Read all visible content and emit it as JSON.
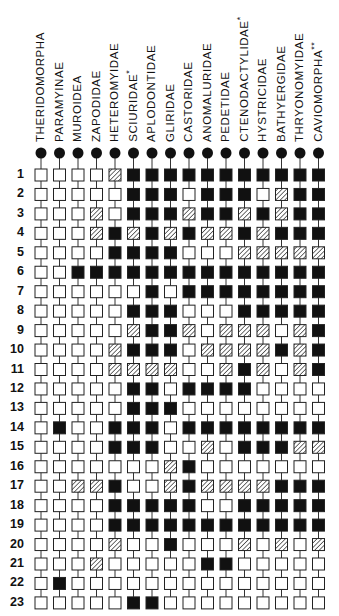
{
  "figure": {
    "type": "character-state-matrix",
    "legend_states": {
      "0": "open (white) square",
      "1": "hatched square",
      "2": "filled (black) square"
    },
    "colors": {
      "ink": "#111111",
      "background": "#ffffff"
    }
  },
  "taxa": [
    {
      "label": "THERIDOMORPHA",
      "mark": ""
    },
    {
      "label": "PARAMYINAE",
      "mark": ""
    },
    {
      "label": "MUROIDEA",
      "mark": ""
    },
    {
      "label": "ZAPODIDAE",
      "mark": ""
    },
    {
      "label": "HETEROMYIDAE",
      "mark": ""
    },
    {
      "label": "SCIURIDAE",
      "mark": "*"
    },
    {
      "label": "APLODONTIDAE",
      "mark": ""
    },
    {
      "label": "GLIRIDAE",
      "mark": ""
    },
    {
      "label": "CASTORIDAE",
      "mark": ""
    },
    {
      "label": "ANOMALURIDAE",
      "mark": ""
    },
    {
      "label": "PEDETIDAE",
      "mark": ""
    },
    {
      "label": "CTENODACTYLIDAE",
      "mark": "*"
    },
    {
      "label": "HYSTRICIDAE",
      "mark": ""
    },
    {
      "label": "BATHYERGIDAE",
      "mark": ""
    },
    {
      "label": "THRYONOMYIDAE",
      "mark": ""
    },
    {
      "label": "CAVIOMORPHA",
      "mark": "**"
    }
  ],
  "characters": [
    "1",
    "2",
    "3",
    "4",
    "5",
    "6",
    "7",
    "8",
    "9",
    "10",
    "11",
    "12",
    "13",
    "14",
    "15",
    "16",
    "17",
    "18",
    "19",
    "20",
    "21",
    "22",
    "23"
  ],
  "chart_data": {
    "type": "table",
    "title": "",
    "encoding": "0 = white square, 1 = hatched square, 2 = black square",
    "columns": [
      "THERIDOMORPHA",
      "PARAMYINAE",
      "MUROIDEA",
      "ZAPODIDAE",
      "HETEROMYIDAE",
      "SCIURIDAE*",
      "APLODONTIDAE",
      "GLIRIDAE",
      "CASTORIDAE",
      "ANOMALURIDAE",
      "PEDETIDAE",
      "CTENODACTYLIDAE*",
      "HYSTRICIDAE",
      "BATHYERGIDAE",
      "THRYONOMYIDAE",
      "CAVIOMORPHA**"
    ],
    "rows": [
      [
        0,
        0,
        0,
        0,
        1,
        2,
        2,
        2,
        2,
        2,
        2,
        2,
        2,
        2,
        2,
        2
      ],
      [
        0,
        0,
        0,
        0,
        0,
        2,
        2,
        2,
        0,
        2,
        2,
        2,
        0,
        1,
        2,
        2
      ],
      [
        0,
        0,
        0,
        1,
        0,
        2,
        2,
        2,
        1,
        2,
        2,
        1,
        2,
        1,
        2,
        2
      ],
      [
        0,
        0,
        0,
        1,
        2,
        1,
        2,
        1,
        2,
        1,
        1,
        2,
        1,
        2,
        2,
        2
      ],
      [
        0,
        0,
        0,
        0,
        2,
        2,
        2,
        2,
        0,
        0,
        0,
        1,
        1,
        1,
        1,
        1
      ],
      [
        0,
        0,
        2,
        2,
        2,
        2,
        2,
        2,
        2,
        2,
        2,
        2,
        2,
        2,
        2,
        2
      ],
      [
        0,
        0,
        0,
        0,
        0,
        0,
        2,
        0,
        2,
        2,
        2,
        2,
        2,
        2,
        2,
        2
      ],
      [
        0,
        0,
        0,
        0,
        0,
        2,
        2,
        2,
        0,
        0,
        0,
        2,
        2,
        2,
        2,
        2
      ],
      [
        0,
        0,
        0,
        0,
        0,
        1,
        2,
        2,
        1,
        0,
        1,
        1,
        1,
        0,
        1,
        2
      ],
      [
        0,
        0,
        0,
        0,
        1,
        2,
        2,
        2,
        0,
        1,
        1,
        1,
        1,
        2,
        1,
        2
      ],
      [
        0,
        0,
        0,
        0,
        1,
        1,
        1,
        1,
        0,
        0,
        1,
        2,
        1,
        0,
        1,
        2
      ],
      [
        0,
        0,
        0,
        0,
        0,
        2,
        2,
        0,
        2,
        2,
        2,
        2,
        0,
        0,
        0,
        0
      ],
      [
        0,
        0,
        0,
        0,
        0,
        2,
        2,
        2,
        0,
        0,
        0,
        0,
        0,
        0,
        0,
        0
      ],
      [
        0,
        2,
        0,
        0,
        2,
        2,
        2,
        0,
        2,
        2,
        2,
        2,
        2,
        2,
        2,
        2
      ],
      [
        0,
        0,
        0,
        0,
        2,
        2,
        2,
        0,
        0,
        1,
        0,
        2,
        2,
        2,
        1,
        1
      ],
      [
        0,
        0,
        0,
        0,
        0,
        0,
        0,
        1,
        2,
        0,
        0,
        0,
        0,
        0,
        0,
        0
      ],
      [
        0,
        0,
        1,
        1,
        2,
        0,
        0,
        1,
        2,
        1,
        1,
        1,
        1,
        2,
        2,
        2
      ],
      [
        0,
        0,
        0,
        0,
        2,
        2,
        2,
        2,
        2,
        0,
        0,
        2,
        2,
        2,
        2,
        2
      ],
      [
        0,
        0,
        0,
        0,
        2,
        2,
        2,
        2,
        2,
        2,
        2,
        2,
        2,
        2,
        2,
        2
      ],
      [
        0,
        0,
        0,
        0,
        1,
        0,
        0,
        2,
        0,
        0,
        0,
        1,
        0,
        1,
        0,
        1
      ],
      [
        0,
        0,
        0,
        1,
        0,
        0,
        0,
        0,
        0,
        2,
        2,
        0,
        0,
        0,
        0,
        0
      ],
      [
        0,
        2,
        0,
        0,
        0,
        0,
        0,
        0,
        0,
        0,
        0,
        0,
        0,
        0,
        0,
        0
      ],
      [
        0,
        0,
        0,
        0,
        0,
        2,
        2,
        0,
        0,
        0,
        0,
        0,
        0,
        0,
        0,
        0
      ]
    ]
  },
  "layout": {
    "col_x0": 41,
    "col_dx": 18.5,
    "row_y0": 175,
    "row_dy": 19.45,
    "root_y": 153,
    "cell_size": 12,
    "label_bottom": 142
  }
}
